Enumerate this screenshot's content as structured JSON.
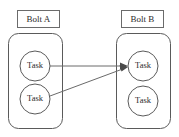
{
  "canvas": {
    "width": 179,
    "height": 137,
    "background": "#ffffff",
    "stroke_color": "#5a5a5a",
    "text_color": "#2b2b2b",
    "edge_color": "#6a6a6a"
  },
  "groups": [
    {
      "id": "bolt-a",
      "label": "Bolt A",
      "label_box": {
        "x": 17,
        "y": 10,
        "w": 42,
        "h": 17
      },
      "container": {
        "x": 8,
        "y": 33,
        "w": 54,
        "h": 95,
        "r": 10
      },
      "tasks": [
        {
          "id": "task-a1",
          "label": "Task",
          "cx": 35,
          "cy": 66,
          "r": 15
        },
        {
          "id": "task-a2",
          "label": "Task",
          "cx": 35,
          "cy": 99,
          "r": 15
        }
      ]
    },
    {
      "id": "bolt-b",
      "label": "Bolt B",
      "label_box": {
        "x": 121,
        "y": 10,
        "w": 42,
        "h": 17
      },
      "container": {
        "x": 116,
        "y": 33,
        "w": 54,
        "h": 95,
        "r": 10
      },
      "tasks": [
        {
          "id": "task-b1",
          "label": "Task",
          "cx": 143,
          "cy": 66,
          "r": 15
        },
        {
          "id": "task-b2",
          "label": "Task",
          "cx": 143,
          "cy": 101,
          "r": 15
        }
      ]
    }
  ],
  "edges": [
    {
      "id": "edge-a1-b1",
      "from": "task-a1",
      "to": "task-b1",
      "x1": 50,
      "y1": 66,
      "x2": 127,
      "y2": 66,
      "arrow": "triangle"
    },
    {
      "id": "edge-a2-b1",
      "from": "task-a2",
      "to": "task-b1",
      "x1": 50,
      "y1": 96,
      "x2": 127,
      "y2": 68,
      "arrow": "triangle"
    }
  ]
}
